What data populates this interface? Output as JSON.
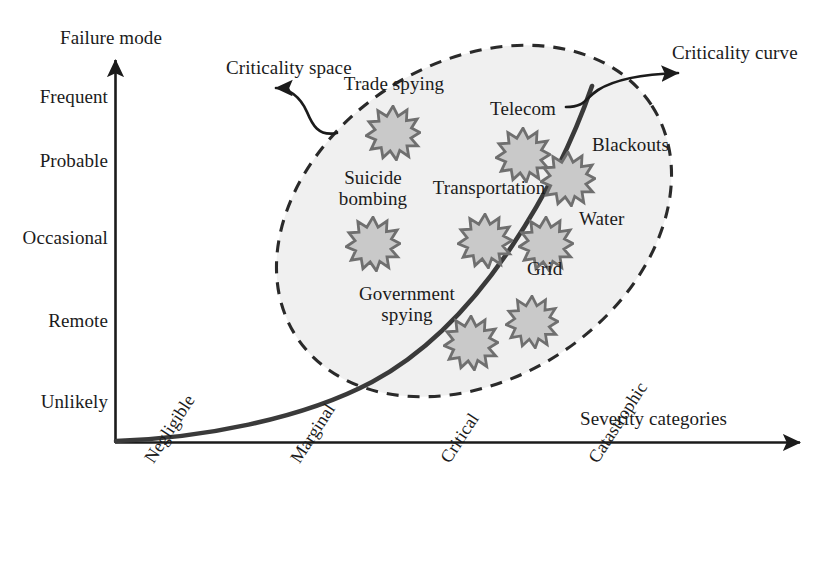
{
  "figure": {
    "type": "diagram",
    "kind": "risk-criticality-matrix",
    "background": "#ffffff",
    "ink": "#1b1b1b",
    "ellipse_fill": "#f0f0f0",
    "star_fill": "#c9c9c9",
    "star_stroke": "#6f6f6f"
  },
  "axes": {
    "y": {
      "title": "Failure mode",
      "ticks": [
        "Frequent",
        "Probable",
        "Occasional",
        "Remote",
        "Unlikely"
      ]
    },
    "x": {
      "title": "Severity categories",
      "ticks": [
        "Negligible",
        "Marginal",
        "Critical",
        "Catastrophic"
      ]
    }
  },
  "annotations": {
    "space": "Criticality space",
    "curve": "Criticality curve"
  },
  "items": [
    {
      "label": "Trade spying",
      "severity": "Critical",
      "failure_mode": "Frequent"
    },
    {
      "label": "Telecom",
      "severity": "Critical",
      "failure_mode": "Probable"
    },
    {
      "label": "Blackouts",
      "severity": "Catastrophic",
      "failure_mode": "Probable"
    },
    {
      "label": "Suicide bombing",
      "severity": "Marginal",
      "failure_mode": "Occasional"
    },
    {
      "label": "Transportation",
      "severity": "Critical",
      "failure_mode": "Occasional"
    },
    {
      "label": "Water",
      "severity": "Catastrophic",
      "failure_mode": "Occasional"
    },
    {
      "label": "Grid",
      "severity": "Catastrophic",
      "failure_mode": "Remote"
    },
    {
      "label": "Government spying",
      "severity": "Critical",
      "failure_mode": "Remote"
    }
  ],
  "item_labels": {
    "trade_spying": "Trade spying",
    "telecom": "Telecom",
    "blackouts": "Blackouts",
    "suicide_bombing_1": "Suicide",
    "suicide_bombing_2": "bombing",
    "transportation": "Transportation",
    "water": "Water",
    "grid": "Grid",
    "government_spying_1": "Government",
    "government_spying_2": "spying"
  }
}
